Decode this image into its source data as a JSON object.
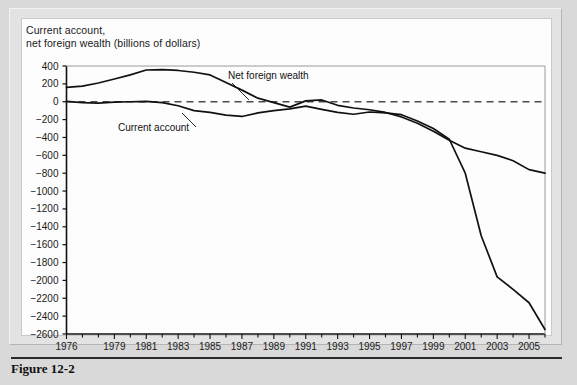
{
  "figure": {
    "caption": "Figure 12-2",
    "title_line1": "Current account,",
    "title_line2": "net foreign wealth (billions of dollars)"
  },
  "chart_data": {
    "type": "line",
    "xlabel": "",
    "ylabel": "billions of dollars",
    "ylim": [
      -2600,
      400
    ],
    "xlim": [
      1976,
      2006
    ],
    "ytick_step": 200,
    "yticks": [
      400,
      200,
      0,
      -200,
      -400,
      -600,
      -800,
      -1000,
      -1200,
      -1400,
      -1600,
      -1800,
      -2000,
      -2200,
      -2400,
      -2600
    ],
    "ytick_labels": [
      "400",
      "200",
      "0",
      "−200",
      "−400",
      "−600",
      "−800",
      "−1000",
      "−1200",
      "−1400",
      "−1600",
      "−1800",
      "−2000",
      "−2200",
      "−2400",
      "−2600"
    ],
    "xticks": [
      1976,
      1977,
      1978,
      1979,
      1980,
      1981,
      1982,
      1983,
      1984,
      1985,
      1986,
      1987,
      1988,
      1989,
      1990,
      1991,
      1992,
      1993,
      1994,
      1995,
      1996,
      1997,
      1998,
      1999,
      2000,
      2001,
      2002,
      2003,
      2004,
      2005,
      2006
    ],
    "xtick_labels_shown": [
      "1976",
      "1979",
      "1981",
      "1983",
      "1985",
      "1987",
      "1989",
      "1991",
      "1993",
      "1995",
      "1997",
      "1999",
      "2001",
      "2003",
      "2005"
    ],
    "xtick_labels_shown_years": [
      1976,
      1979,
      1981,
      1983,
      1985,
      1987,
      1989,
      1991,
      1993,
      1995,
      1997,
      1999,
      2001,
      2003,
      2005
    ],
    "grid": false,
    "zero_line": {
      "value": 0,
      "style": "dashed"
    },
    "legend_position": "inline-annotations",
    "x": [
      1976,
      1977,
      1978,
      1979,
      1980,
      1981,
      1982,
      1983,
      1984,
      1985,
      1986,
      1987,
      1988,
      1989,
      1990,
      1991,
      1992,
      1993,
      1994,
      1995,
      1996,
      1997,
      1998,
      1999,
      2000,
      2001,
      2002,
      2003,
      2004,
      2005,
      2006
    ],
    "series": [
      {
        "name": "Net foreign wealth",
        "color": "#111111",
        "values": [
          160,
          175,
          210,
          255,
          300,
          355,
          360,
          350,
          330,
          300,
          215,
          130,
          40,
          -10,
          -60,
          10,
          20,
          -40,
          -70,
          -90,
          -120,
          -170,
          -240,
          -330,
          -430,
          -520,
          -560,
          -600,
          -660,
          -760,
          -800
        ]
      },
      {
        "name": "Current account",
        "color": "#111111",
        "values": [
          5,
          -10,
          -15,
          -5,
          0,
          5,
          -10,
          -45,
          -100,
          -120,
          -150,
          -165,
          -125,
          -100,
          -80,
          -50,
          -85,
          -120,
          -140,
          -115,
          -125,
          -145,
          -215,
          -300,
          -420,
          -800,
          -1500,
          -1960,
          -2100,
          -2250,
          -2550
        ]
      }
    ],
    "annotations": [
      {
        "text": "Net foreign wealth",
        "series": "Net foreign wealth",
        "x": 1986,
        "leader": true
      },
      {
        "text": "Current account",
        "series": "Current account",
        "x": 1985,
        "leader": true
      }
    ]
  }
}
